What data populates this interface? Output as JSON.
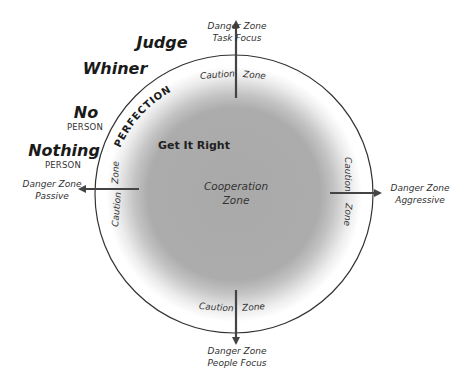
{
  "diagram": {
    "center_label": {
      "line1": "Cooperation",
      "line2": "Zone"
    },
    "inner_label": "Get It Right",
    "arc_label": "PERFECTION",
    "caution": {
      "top": {
        "left": "Caution",
        "right": "Zone"
      },
      "right": {
        "top": "Caution",
        "bottom": "Zone"
      },
      "bottom": {
        "left": "Caution",
        "right": "Zone"
      },
      "left": {
        "top": "Zone",
        "bottom": "Caution"
      }
    },
    "danger": {
      "top": {
        "line1": "Danger Zone",
        "line2": "Task Focus"
      },
      "right": {
        "line1": "Danger Zone",
        "line2": "Aggressive"
      },
      "bottom": {
        "line1": "Danger Zone",
        "line2": "People Focus"
      },
      "left": {
        "line1": "Danger Zone",
        "line2": "Passive"
      }
    },
    "types": [
      {
        "name": "Judge",
        "sub": ""
      },
      {
        "name": "Whiner",
        "sub": ""
      },
      {
        "name": "No",
        "sub": "PERSON"
      },
      {
        "name": "Nothing",
        "sub": "PERSON"
      }
    ],
    "colors": {
      "inner": "#a8a8a8",
      "outer_ring": "#ffffff",
      "stroke": "#333333",
      "arrow": "#444444"
    }
  }
}
